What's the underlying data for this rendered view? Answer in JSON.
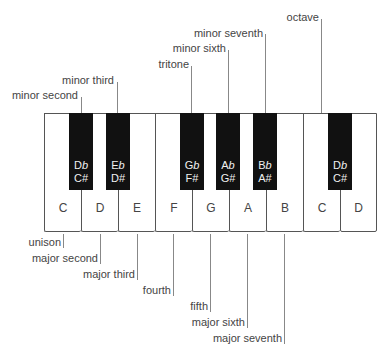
{
  "diagram": {
    "title": "",
    "white_keys": [
      "C",
      "D",
      "E",
      "F",
      "G",
      "A",
      "B",
      "C",
      "D"
    ],
    "black_keys": [
      {
        "flat_letter": "D",
        "flat_sym": "b",
        "sharp": "C#"
      },
      {
        "flat_letter": "E",
        "flat_sym": "b",
        "sharp": "D#"
      },
      {
        "flat_letter": "G",
        "flat_sym": "b",
        "sharp": "F#"
      },
      {
        "flat_letter": "A",
        "flat_sym": "b",
        "sharp": "G#"
      },
      {
        "flat_letter": "B",
        "flat_sym": "b",
        "sharp": "A#"
      },
      {
        "flat_letter": "D",
        "flat_sym": "b",
        "sharp": "C#"
      }
    ],
    "top_intervals": [
      "minor second",
      "minor third",
      "tritone",
      "minor sixth",
      "minor seventh",
      "octave"
    ],
    "bottom_intervals": [
      "unison",
      "major second",
      "major third",
      "fourth",
      "fifth",
      "major sixth",
      "major seventh"
    ],
    "colors": {
      "black_key": "#111111",
      "white_key": "#ffffff",
      "outline": "#555555",
      "leader_line": "#888888",
      "text": "#444444"
    }
  }
}
